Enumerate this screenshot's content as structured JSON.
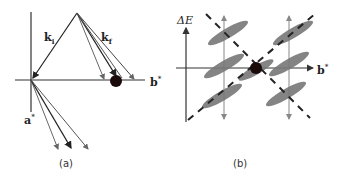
{
  "header": {
    "clipped_text": ""
  },
  "panel_a": {
    "caption": "(a)",
    "labels": {
      "k_i": "k",
      "k_i_sub": "i",
      "k_f": "k",
      "k_f_sub": "f",
      "b_star": "b",
      "a_star": "a",
      "star": "*"
    },
    "colors": {
      "axis": "#333333",
      "vector_dark": "#222222",
      "vector_gray": "#666666",
      "dot": "#1a0a0a"
    }
  },
  "panel_b": {
    "caption": "(b)",
    "labels": {
      "delta_e": "ΔE",
      "b_star": "b",
      "star": "*"
    },
    "colors": {
      "axis": "#333333",
      "ellipse": "#777777",
      "dashed": "#222222",
      "gray_arrow": "#888888",
      "dot": "#1a0a0a"
    }
  }
}
